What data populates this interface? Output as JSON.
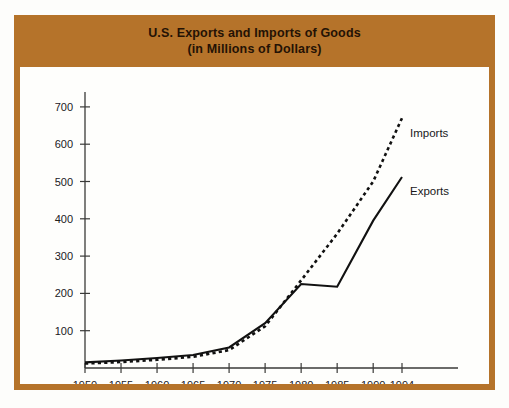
{
  "figure": {
    "frame_color": "#b5732a",
    "panel_color": "#fefefc",
    "page_color": "#ffffff"
  },
  "title": {
    "line1": "U.S. Exports and Imports of Goods",
    "line2": "(in Millions of Dollars)"
  },
  "chart_data": {
    "type": "line",
    "title": "U.S. Exports and Imports of Goods (in Millions of Dollars)",
    "xlabel": "",
    "ylabel": "",
    "x": [
      1950,
      1955,
      1960,
      1965,
      1970,
      1975,
      1980,
      1985,
      1990,
      1994
    ],
    "xtick_labels": [
      "1950",
      "1955",
      "1960",
      "1965",
      "1970",
      "1975",
      "1980",
      "1985",
      "1990",
      "1994"
    ],
    "ytick_labels": [
      "100",
      "200",
      "300",
      "400",
      "500",
      "600",
      "700"
    ],
    "yticks": [
      100,
      200,
      300,
      400,
      500,
      600,
      700
    ],
    "xlim": [
      1950,
      1994
    ],
    "ylim": [
      0,
      740
    ],
    "grid": false,
    "legend_position": "inline-right",
    "series": [
      {
        "name": "Exports",
        "style": "solid",
        "color": "#111111",
        "values": [
          15,
          20,
          27,
          35,
          55,
          120,
          225,
          218,
          395,
          512
        ]
      },
      {
        "name": "Imports",
        "style": "dotted",
        "color": "#111111",
        "values": [
          12,
          16,
          22,
          30,
          48,
          112,
          235,
          360,
          500,
          670
        ]
      }
    ],
    "annotations": [
      {
        "text": "Imports",
        "series": "Imports",
        "x": 1994,
        "y": 620
      },
      {
        "text": "Exports",
        "series": "Exports",
        "x": 1994,
        "y": 465
      }
    ]
  }
}
